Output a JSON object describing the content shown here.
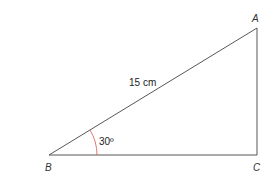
{
  "diagram": {
    "type": "right-triangle",
    "vertices": {
      "A": {
        "label": "A"
      },
      "B": {
        "label": "B"
      },
      "C": {
        "label": "C"
      }
    },
    "hypotenuse": {
      "from": "B",
      "to": "A",
      "label": "15 cm"
    },
    "angle": {
      "vertex": "B",
      "label": "30º",
      "arc_color": "#d9534f"
    },
    "line_color": "#444444"
  }
}
